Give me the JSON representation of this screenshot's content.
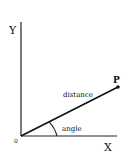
{
  "diagram": {
    "type": "polar-coordinate-illustration",
    "axes": {
      "y_label": "Y",
      "x_label": "X",
      "origin_label": "0"
    },
    "point": {
      "label": "P"
    },
    "segment_label": "distance",
    "angle_label": "angle",
    "colors": {
      "line": "#111111",
      "background": "#ffffff"
    }
  }
}
